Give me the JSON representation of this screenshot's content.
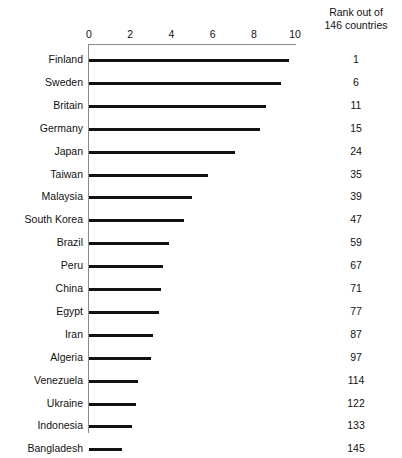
{
  "chart_data": {
    "type": "bar",
    "orientation": "horizontal",
    "title": "",
    "subtitle": "",
    "xlabel": "",
    "ylabel": "",
    "xlim": [
      0,
      10
    ],
    "xticks": [
      0,
      2,
      4,
      6,
      8,
      10
    ],
    "xtick_labels": [
      "0",
      "2",
      "4",
      "6",
      "8",
      "10"
    ],
    "grid": false,
    "legend": null,
    "categories": [
      "Finland",
      "Sweden",
      "Britain",
      "Germany",
      "Japan",
      "Taiwan",
      "Malaysia",
      "South Korea",
      "Brazil",
      "Peru",
      "China",
      "Egypt",
      "Iran",
      "Algeria",
      "Venezuela",
      "Ukraine",
      "Indonesia",
      "Bangladesh"
    ],
    "values": [
      9.7,
      9.3,
      8.6,
      8.3,
      7.1,
      5.8,
      5.0,
      4.6,
      3.9,
      3.6,
      3.5,
      3.4,
      3.1,
      3.0,
      2.4,
      2.3,
      2.1,
      1.6
    ],
    "series": [
      {
        "name": "Corruption perceptions score",
        "values": [
          9.7,
          9.3,
          8.6,
          8.3,
          7.1,
          5.8,
          5.0,
          4.6,
          3.9,
          3.6,
          3.5,
          3.4,
          3.1,
          3.0,
          2.4,
          2.3,
          2.1,
          1.6
        ]
      }
    ],
    "annotations": {
      "rank_column_header": [
        "Rank out of",
        "146 countries"
      ],
      "ranks": [
        1,
        6,
        11,
        15,
        24,
        35,
        39,
        47,
        59,
        67,
        71,
        77,
        87,
        97,
        114,
        122,
        133,
        145
      ]
    },
    "colors": {
      "bar": "#111111",
      "axis": "#8b8b8b",
      "text": "#111111",
      "background": "#ffffff"
    }
  },
  "header": {
    "rank_title_line1": "Rank out of",
    "rank_title_line2": "146 countries"
  }
}
